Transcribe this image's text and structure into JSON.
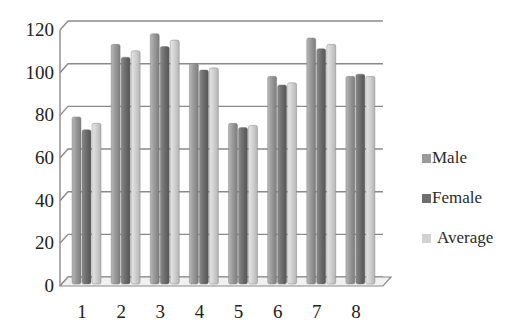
{
  "chart_data": {
    "type": "bar",
    "title": "",
    "xlabel": "",
    "ylabel": "",
    "categories": [
      "1",
      "2",
      "3",
      "4",
      "5",
      "6",
      "7",
      "8"
    ],
    "series": [
      {
        "name": "Male",
        "color": "#9a9a9a",
        "values": [
          76,
          110,
          115,
          101,
          73,
          95,
          113,
          95
        ]
      },
      {
        "name": "Female",
        "color": "#6e6e6e",
        "values": [
          70,
          104,
          109,
          98,
          71,
          91,
          108,
          96
        ]
      },
      {
        "name": "Average",
        "color": "#d2d2d2",
        "values": [
          73,
          107,
          112,
          99,
          72,
          92,
          110,
          95
        ]
      }
    ],
    "ylim": [
      0,
      120
    ],
    "yticks": [
      0,
      20,
      40,
      60,
      80,
      100,
      120
    ],
    "grid": true,
    "style": "3d-cylinder-ish clustered bars",
    "legend_position": "right"
  },
  "legend": {
    "items": [
      {
        "label": "Male",
        "color": "#9a9a9a"
      },
      {
        "label": "Female",
        "color": "#6e6e6e"
      },
      {
        "label": "Average",
        "color": "#d2d2d2"
      }
    ]
  }
}
